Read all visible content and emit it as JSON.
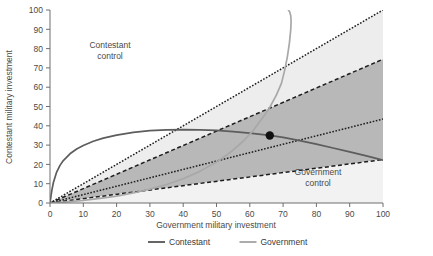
{
  "chart_data": {
    "type": "line",
    "title": "",
    "xlabel": "Government military investment",
    "ylabel": "Contestant military investment",
    "xlim": [
      0,
      100
    ],
    "ylim": [
      0,
      100
    ],
    "xticks": [
      0,
      10,
      20,
      30,
      40,
      50,
      60,
      70,
      80,
      90,
      100
    ],
    "yticks": [
      0,
      10,
      20,
      30,
      40,
      50,
      60,
      70,
      80,
      90,
      100
    ],
    "grid": false,
    "legend_position": "bottom",
    "annotations": [
      {
        "text_line1": "Contestant",
        "text_line2": "control",
        "x": 18,
        "y": 76
      },
      {
        "text_line1": "Government",
        "text_line2": "control",
        "x": 79,
        "y": 14
      }
    ],
    "equilibrium_point": {
      "x": 66,
      "y": 35,
      "marker": "filled-circle"
    },
    "series": [
      {
        "name": "Contestant",
        "style": "solid",
        "color": "#5d5d5d",
        "x": [
          0,
          0.5,
          1,
          2,
          3,
          4,
          6,
          8,
          10,
          13,
          16,
          20,
          25,
          30,
          35,
          40,
          45,
          50,
          55,
          60,
          66,
          70,
          75,
          80,
          85,
          90,
          95,
          100
        ],
        "y": [
          0,
          6,
          10.5,
          16,
          19.5,
          22,
          25.5,
          28,
          29.8,
          32,
          33.6,
          35.2,
          36.6,
          37.5,
          37.9,
          38.0,
          37.9,
          37.6,
          37.0,
          36.2,
          35.0,
          34.0,
          32.3,
          30.5,
          28.5,
          26.5,
          24.4,
          22.2
        ]
      },
      {
        "name": "Government",
        "style": "solid",
        "color": "#a8a8a8",
        "x": [
          0,
          5,
          10,
          15,
          20,
          25,
          30,
          35,
          40,
          45,
          50,
          54,
          58,
          61,
          64,
          66,
          68,
          69.5,
          70.5,
          71.3,
          71.9,
          72.3,
          72.4,
          72.3,
          72.0,
          71.6
        ],
        "y": [
          0,
          0.6,
          1.4,
          2.4,
          3.6,
          5.2,
          7.2,
          9.6,
          12.6,
          16.4,
          21.2,
          26.0,
          32.0,
          37.5,
          44.5,
          49.5,
          56.0,
          62.0,
          69.0,
          76.0,
          83.0,
          90.0,
          94.0,
          97.0,
          99.0,
          100
        ]
      }
    ],
    "boundary_rays": [
      {
        "name": "upper-contestant-boundary",
        "slope": 1.0,
        "style": "dotted",
        "color": "#1d1d1d"
      },
      {
        "name": "contest-zone-upper",
        "slope": 0.745,
        "style": "dashed",
        "color": "#1d1d1d"
      },
      {
        "name": "contest-zone-mid",
        "slope": 0.435,
        "style": "dotted",
        "color": "#1d1d1d"
      },
      {
        "name": "lower-government-boundary",
        "slope": 0.225,
        "style": "dashed",
        "color": "#1d1d1d"
      }
    ],
    "bands": [
      {
        "name": "contestant-advantage-band",
        "fill": "#ededed",
        "slope_top": 1.0,
        "slope_bottom": 0.745
      },
      {
        "name": "contested-band",
        "fill": "#b8b8b8",
        "slope_top": 0.745,
        "slope_bottom": 0.225
      },
      {
        "name": "government-advantage-band",
        "fill": "#f2f2f2",
        "slope_top": 0.225,
        "slope_bottom": 0.0
      }
    ],
    "legend": [
      {
        "label": "Contestant",
        "color": "#5d5d5d"
      },
      {
        "label": "Government",
        "color": "#a8a8a8"
      }
    ]
  }
}
